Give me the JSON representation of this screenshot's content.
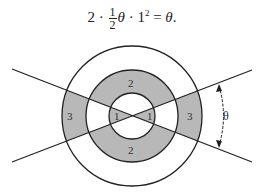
{
  "equation": {
    "coef": "2",
    "dot1": " · ",
    "frac_num": "1",
    "frac_den": "2",
    "theta": "θ",
    "dot2": " · ",
    "one": "1",
    "exp": "2",
    "equals": " = ",
    "rhs": "θ",
    "period": "."
  },
  "diagram": {
    "center": [
      132,
      116
    ],
    "radii": [
      23,
      46,
      70
    ],
    "shaded_color": "#b8b8b8",
    "line_color": "#222222",
    "region_labels": {
      "inner_left": "1",
      "inner_right": "1",
      "middle_top": "2",
      "middle_bottom": "2",
      "outer_left": "3",
      "outer_right": "3"
    },
    "angle_label": "θ"
  }
}
